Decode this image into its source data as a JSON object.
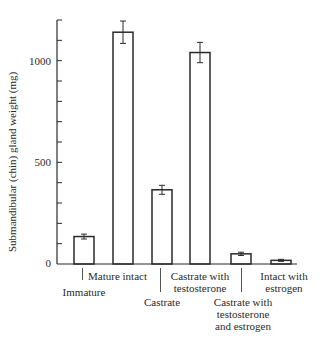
{
  "chart_data": {
    "type": "bar",
    "title": "",
    "xlabel": "",
    "ylabel": "Submandibular (chin) gland weight (mg)",
    "ylim": [
      0,
      1200
    ],
    "yticks_major": [
      0,
      500,
      1000
    ],
    "yticks_minor_step": 100,
    "grid": false,
    "legend": null,
    "categories": [
      "Immature",
      "Mature intact",
      "Castrate",
      "Castrate with testosterone",
      "Castrate with testosterone and estrogen",
      "Intact with estrogen"
    ],
    "values": [
      135,
      1140,
      365,
      1040,
      50,
      18
    ],
    "errors": [
      12,
      55,
      22,
      50,
      8,
      5
    ],
    "bar_style": "hollow outline"
  },
  "axis": {
    "ylabel": "Submandibular (chin) gland weight (mg)",
    "ytick_labels": [
      "0",
      "500",
      "1000"
    ]
  },
  "labels": [
    {
      "lines": [
        "Immature"
      ]
    },
    {
      "lines": [
        "Mature intact"
      ]
    },
    {
      "lines": [
        "Castrate"
      ]
    },
    {
      "lines": [
        "Castrate with",
        "testosterone"
      ]
    },
    {
      "lines": [
        "Castrate with",
        "testosterone",
        "and estrogen"
      ]
    },
    {
      "lines": [
        "Intact with",
        "estrogen"
      ]
    }
  ],
  "colors": {
    "ink": "#2a2a2a",
    "background": "#ffffff"
  }
}
